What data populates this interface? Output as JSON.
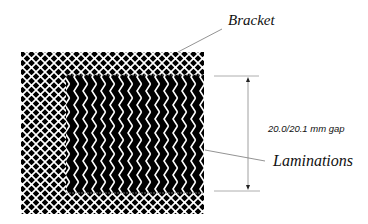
{
  "diagram": {
    "labels": {
      "bracket": "Bracket",
      "laminations": "Laminations",
      "gap": "20.0/20.1 mm gap"
    },
    "colors": {
      "fill": "#000000",
      "pattern": "#ffffff",
      "lines": "#777777",
      "background": "#ffffff"
    },
    "components": [
      {
        "name": "bracket",
        "pattern": "crosshatch-lattice",
        "bbox": [
          21,
          52,
          204,
          214
        ]
      },
      {
        "name": "laminations",
        "pattern": "chevron",
        "bbox": [
          66,
          75,
          204,
          193
        ]
      }
    ],
    "dimension": {
      "value": "20.0/20.1 mm gap",
      "x": 248,
      "y_top": 76,
      "y_bottom": 191
    }
  }
}
